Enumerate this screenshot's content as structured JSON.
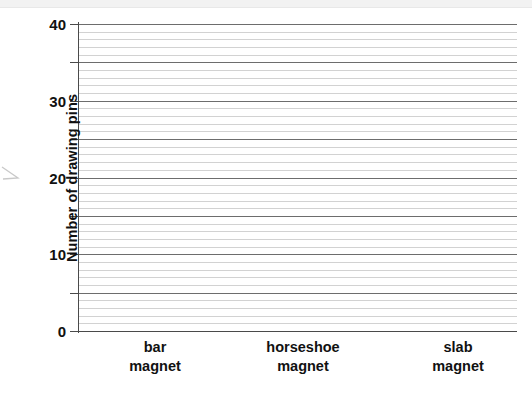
{
  "chart_data": {
    "type": "bar",
    "title": "",
    "subtitle": "",
    "xlabel": "",
    "ylabel": "Number of drawing pins",
    "categories": [
      "bar\nmagnet",
      "horseshoe\nmagnet",
      "slab\nmagnet"
    ],
    "category_lines": [
      [
        "bar",
        "magnet"
      ],
      [
        "horseshoe",
        "magnet"
      ],
      [
        "slab",
        "magnet"
      ]
    ],
    "values": [
      null,
      null,
      null
    ],
    "series": [
      {
        "name": "Number of drawing pins",
        "values": [
          null,
          null,
          null
        ]
      }
    ],
    "ylim": [
      0,
      40
    ],
    "ytick_labels": [
      "0",
      "10",
      "20",
      "30",
      "40"
    ],
    "ytick_values": [
      0,
      10,
      20,
      30,
      40
    ],
    "major_gridline_values": [
      0,
      5,
      10,
      15,
      20,
      25,
      30,
      35,
      40
    ],
    "minor_gridline_step": 1,
    "grid": true,
    "grid_orientation": "horizontal",
    "legend": false,
    "legend_position": "none",
    "colors": {
      "major_gridline": "#6d6d6d",
      "minor_gridline": "#d2d2d2",
      "axis": "#4a4a4a",
      "text": "#111111",
      "background": "#ffffff",
      "top_band": "#f2f2f2"
    }
  },
  "axes": {
    "y_title": "Number of drawing pins",
    "y_ticks": [
      {
        "value": 0,
        "label": "0"
      },
      {
        "value": 10,
        "label": "10"
      },
      {
        "value": 20,
        "label": "20"
      },
      {
        "value": 30,
        "label": "30"
      },
      {
        "value": 40,
        "label": "40"
      }
    ],
    "x_categories": [
      {
        "line1": "bar",
        "line2": "magnet",
        "center_x": 155
      },
      {
        "line1": "horseshoe",
        "line2": "magnet",
        "center_x": 303
      },
      {
        "line1": "slab",
        "line2": "magnet",
        "center_x": 458
      }
    ]
  },
  "artifacts": {
    "edge_arrow": "arrow-artifact"
  }
}
